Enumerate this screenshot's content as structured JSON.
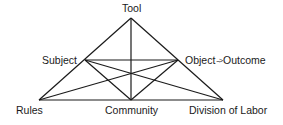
{
  "diagram": {
    "line_color": "#1a1a1a",
    "nodes": {
      "tool": {
        "label": "Tool",
        "x": 131,
        "y": 18
      },
      "subject": {
        "label": "Subject",
        "x": 85,
        "y": 60
      },
      "object": {
        "label": "Object",
        "x": 178,
        "y": 60
      },
      "outcome": {
        "label": "Outcome"
      },
      "rules": {
        "label": "Rules",
        "x": 39,
        "y": 100
      },
      "community": {
        "label": "Community",
        "x": 131,
        "y": 100
      },
      "division": {
        "label": "Division of Labor",
        "x": 223,
        "y": 100
      }
    },
    "object_outcome_arrow": "-->",
    "edges": [
      [
        "tool",
        "rules"
      ],
      [
        "tool",
        "division"
      ],
      [
        "rules",
        "division"
      ],
      [
        "tool",
        "community"
      ],
      [
        "subject",
        "object"
      ],
      [
        "subject",
        "community"
      ],
      [
        "object",
        "community"
      ],
      [
        "subject",
        "division"
      ],
      [
        "object",
        "rules"
      ]
    ]
  }
}
